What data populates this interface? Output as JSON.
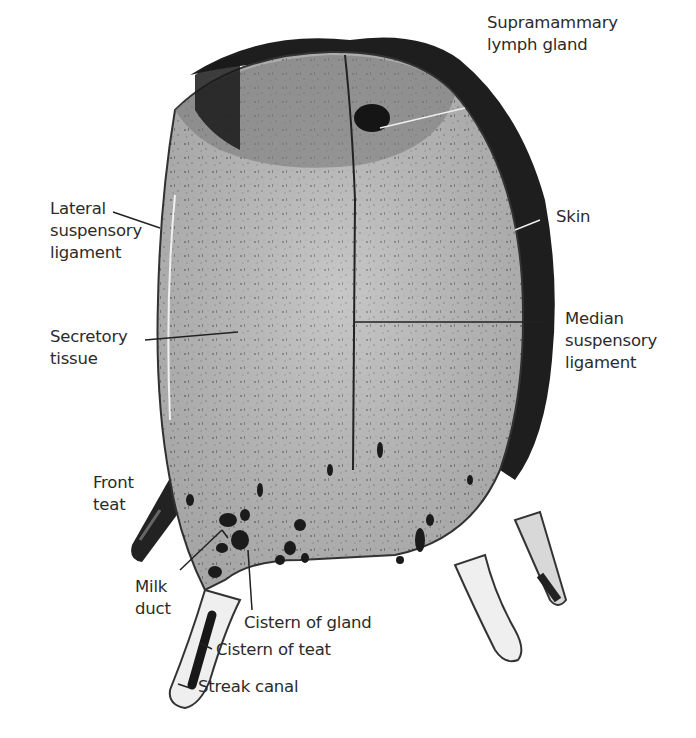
{
  "figure": {
    "colors": {
      "background": "#ffffff",
      "tissue": "#b9b9b9",
      "skin": "#1e1e1e",
      "ink": "#2b2b2b"
    }
  },
  "labels": {
    "supramammary": {
      "lines": [
        "Supramammary",
        "lymph gland"
      ]
    },
    "skin": {
      "lines": [
        "Skin"
      ]
    },
    "lateral": {
      "lines": [
        "Lateral",
        "suspensory",
        "ligament"
      ]
    },
    "secretory": {
      "lines": [
        "Secretory",
        "tissue"
      ]
    },
    "median": {
      "lines": [
        "Median",
        "suspensory",
        "ligament"
      ]
    },
    "front_teat": {
      "lines": [
        "Front",
        "teat"
      ]
    },
    "milk_duct": {
      "lines": [
        "Milk",
        "duct"
      ]
    },
    "cistern_gland": {
      "lines": [
        "Cistern of gland"
      ]
    },
    "cistern_teat": {
      "lines": [
        "Cistern of teat"
      ]
    },
    "streak_canal": {
      "lines": [
        "Streak canal"
      ]
    }
  }
}
